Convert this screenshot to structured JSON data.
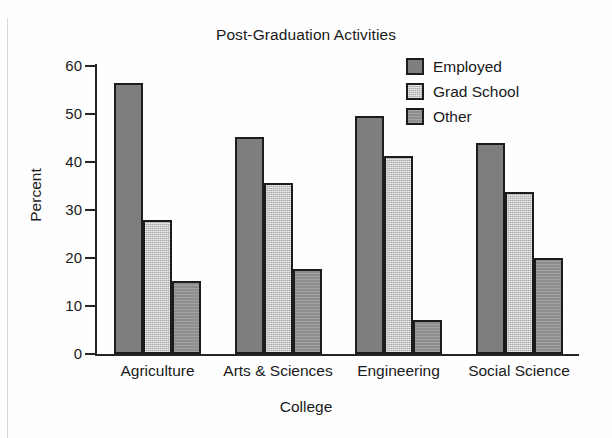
{
  "chart_data": {
    "type": "bar",
    "title": "Post-Graduation Activities",
    "xlabel": "College",
    "ylabel": "Percent",
    "categories": [
      "Agriculture",
      "Arts & Sciences",
      "Engineering",
      "Social Science"
    ],
    "series": [
      {
        "name": "Employed",
        "values": [
          56.5,
          45.3,
          49.5,
          44.0
        ],
        "color": "#7e7e7e"
      },
      {
        "name": "Grad School",
        "values": [
          28.0,
          35.7,
          41.3,
          33.7
        ],
        "color": "#ababab"
      },
      {
        "name": "Other",
        "values": [
          15.3,
          17.7,
          7.0,
          20.0
        ],
        "color": "#8d8d8d"
      }
    ],
    "ylim": [
      0,
      60
    ],
    "yticks": [
      0,
      10,
      20,
      30,
      40,
      50,
      60
    ],
    "ytick_labels": [
      "0",
      "10",
      "20",
      "30",
      "40",
      "50",
      "60"
    ],
    "grid": false,
    "legend_position": "top-right",
    "background_color": "#fefefe",
    "axis_color": "#262626"
  },
  "legend": {
    "items": [
      {
        "label": "Employed"
      },
      {
        "label": "Grad School"
      },
      {
        "label": "Other"
      }
    ]
  }
}
